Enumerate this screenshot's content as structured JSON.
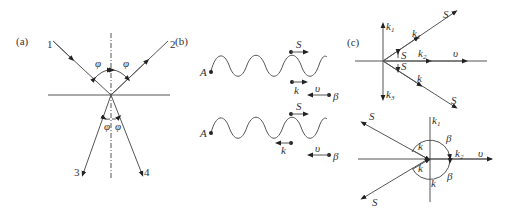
{
  "panels": {
    "a": {
      "label": "(a)",
      "rays": [
        "1",
        "2",
        "3",
        "4"
      ],
      "angle_symbol": "φ"
    },
    "b": {
      "label": "(b)",
      "top": {
        "point_label": "A",
        "s_label": "S",
        "k_label": "k",
        "v_label": "υ",
        "beta_label": "β"
      },
      "bottom": {
        "point_label": "A",
        "s_label": "S",
        "k_label": "k",
        "v_label": "υ",
        "beta_label": "β"
      }
    },
    "c": {
      "label": "(c)",
      "top": {
        "k1": "k",
        "k1_sub": "1",
        "k2": "k",
        "k2_sub": "2",
        "k3": "k",
        "k3_sub": "3",
        "k_upper": "k",
        "k_upper_sub": "1",
        "k_lower": "k",
        "s_upper": "S",
        "s_lower": "S",
        "s_small_1": "S",
        "s_small_2": "S",
        "v": "υ"
      },
      "bottom": {
        "k_top": "k",
        "k_top_sub": "1",
        "k2": "k",
        "k2_sub": "2",
        "k_a": "k",
        "k_b": "k",
        "k_c": "k",
        "beta_1": "β",
        "beta_2": "β",
        "s_upper": "S",
        "s_lower": "S",
        "v": "υ"
      }
    }
  }
}
